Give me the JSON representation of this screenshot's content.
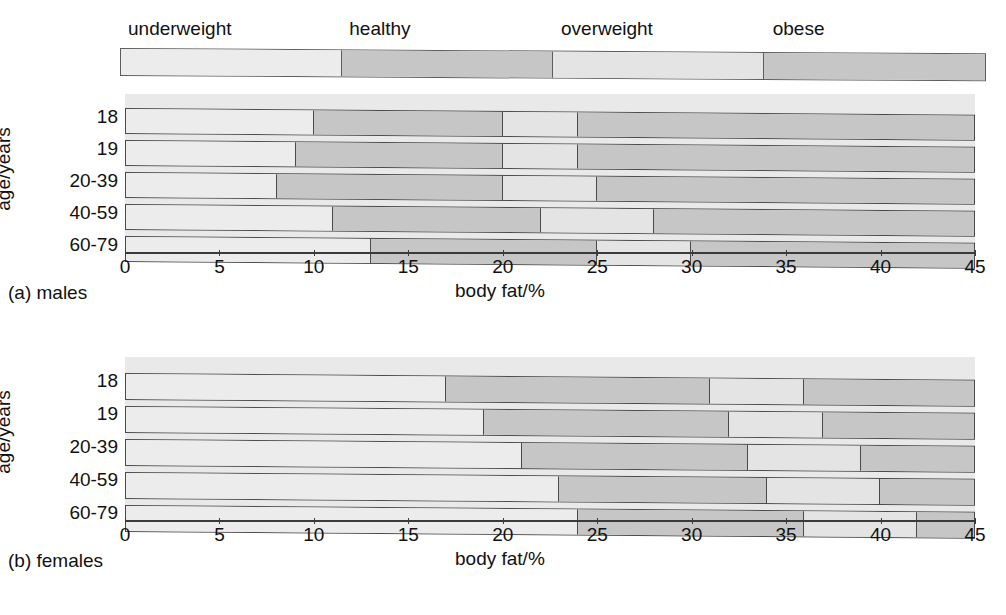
{
  "legend": {
    "categories": [
      {
        "label": "underweight",
        "color": "#ececec",
        "from": 0,
        "to": 11.5
      },
      {
        "label": "healthy",
        "color": "#c6c6c6",
        "from": 11.5,
        "to": 22.5
      },
      {
        "label": "overweight",
        "color": "#e4e4e4",
        "from": 22.5,
        "to": 33.5
      },
      {
        "label": "obese",
        "color": "#c6c6c6",
        "from": 33.5,
        "to": 45
      }
    ]
  },
  "axis": {
    "x_title": "body fat/%",
    "y_title": "age/years",
    "ticks": [
      "0",
      "5",
      "10",
      "15",
      "20",
      "25",
      "30",
      "35",
      "40",
      "45"
    ],
    "xmin": 0,
    "xmax": 45
  },
  "panels": [
    {
      "key": "males",
      "caption": "(a) males"
    },
    {
      "key": "females",
      "caption": "(b) females"
    }
  ],
  "chart_data": {
    "type": "bar",
    "xlabel": "body fat/%",
    "ylabel": "age/years",
    "xlim": [
      0,
      45
    ],
    "grid": false,
    "legend_position": "top",
    "series_names": [
      "underweight",
      "healthy",
      "overweight",
      "obese"
    ],
    "series_colors": [
      "#ececec",
      "#c6c6c6",
      "#e4e4e4",
      "#c6c6c6"
    ],
    "panels": [
      {
        "name": "(a) males",
        "categories": [
          "18",
          "19",
          "20-39",
          "40-59",
          "60-79"
        ],
        "boundaries": [
          {
            "category": "18",
            "cuts": [
              10,
              20,
              24
            ],
            "end": 45
          },
          {
            "category": "19",
            "cuts": [
              9,
              20,
              24
            ],
            "end": 45
          },
          {
            "category": "20-39",
            "cuts": [
              8,
              20,
              25
            ],
            "end": 45
          },
          {
            "category": "40-59",
            "cuts": [
              11,
              22,
              28
            ],
            "end": 45
          },
          {
            "category": "60-79",
            "cuts": [
              13,
              25,
              30
            ],
            "end": 45
          }
        ]
      },
      {
        "name": "(b) females",
        "categories": [
          "18",
          "19",
          "20-39",
          "40-59",
          "60-79"
        ],
        "boundaries": [
          {
            "category": "18",
            "cuts": [
              17,
              31,
              36
            ],
            "end": 45
          },
          {
            "category": "19",
            "cuts": [
              19,
              32,
              37
            ],
            "end": 45
          },
          {
            "category": "20-39",
            "cuts": [
              21,
              33,
              39
            ],
            "end": 45
          },
          {
            "category": "40-59",
            "cuts": [
              23,
              34,
              40
            ],
            "end": 45
          },
          {
            "category": "60-79",
            "cuts": [
              24,
              36,
              42
            ],
            "end": 45
          }
        ]
      }
    ]
  }
}
